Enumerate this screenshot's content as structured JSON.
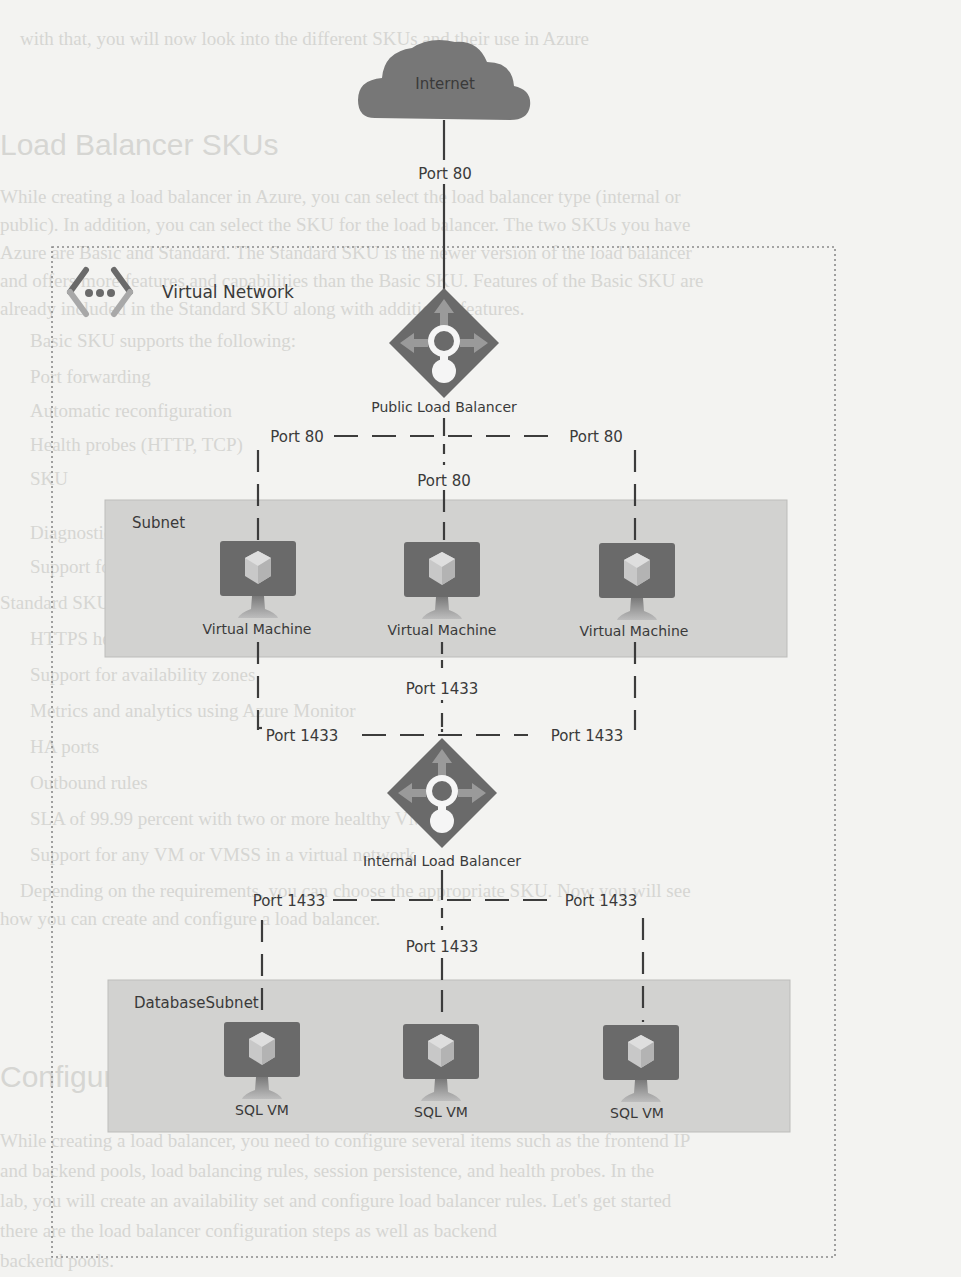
{
  "diagram": {
    "internet": {
      "label": "Internet"
    },
    "virtual_network": {
      "label": "Virtual Network"
    },
    "public_lb": {
      "label": "Public Load Balancer"
    },
    "internal_lb": {
      "label": "Internal Load Balancer"
    },
    "subnet": {
      "label": "Subnet",
      "vms": [
        {
          "label": "Virtual Machine"
        },
        {
          "label": "Virtual Machine"
        },
        {
          "label": "Virtual Machine"
        }
      ]
    },
    "database_subnet": {
      "label": "DatabaseSubnet",
      "vms": [
        {
          "label": "SQL VM"
        },
        {
          "label": "SQL VM"
        },
        {
          "label": "SQL VM"
        }
      ]
    },
    "ports": {
      "internet_to_public_lb": "Port 80",
      "public_lb_left": "Port 80",
      "public_lb_right": "Port 80",
      "public_lb_center": "Port 80",
      "vm_to_internal_lb_center": "Port 1433",
      "internal_lb_in_left": "Port 1433",
      "internal_lb_in_right": "Port 1433",
      "internal_lb_out_left": "Port 1433",
      "internal_lb_out_right": "Port 1433",
      "internal_lb_out_center": "Port 1433"
    },
    "colors": {
      "icon_dark": "#6e6e6e",
      "icon_light": "#a8a8a8",
      "cloud": "#777777",
      "subnet_fill": "#d2d2d0",
      "line": "#3c3c3c",
      "page_bg": "#f3f3f1"
    }
  },
  "background_page": {
    "heading_1": "Load Balancer SKUs",
    "heading_2": "Configure a Load Balancer",
    "lines": [
      "with that, you will now look into the different SKUs and their use in Azure",
      "While creating a load balancer in Azure, you can select the load balancer type (internal or",
      "public). In addition, you can select the SKU for the load balancer. The two SKUs you have",
      "Azure are Basic and Standard. The Standard SKU is the newer version of the load balancer",
      "and offers more features and capabilities than the Basic SKU. Features of the Basic SKU are",
      "already included in the Standard SKU along with additional features.",
      "Basic SKU supports the following:",
      "Port forwarding",
      "Automatic reconfiguration",
      "Health probes (HTTP, TCP)",
      "SKU",
      "Diagnostics using Azure Log Analytics",
      "Support for VMs in a single availability set or VMSS",
      "Standard SKU supports all features of the Basic SKU, along with the following features:",
      "HTTPS health probes",
      "Support for availability zones",
      "Metrics and analytics using Azure Monitor",
      "HA ports",
      "Outbound rules",
      "SLA of 99.99 percent with two or more healthy VMs",
      "Support for any VM or VMSS in a virtual network",
      "Depending on the requirements, you can choose the appropriate SKU. Now you will see",
      "how you can create and configure a load balancer.",
      "While creating a load balancer, you need to configure several items such as the frontend IP",
      "and backend pools, load balancing rules, session persistence, and health probes. In the",
      "lab, you will create an availability set and configure load balancer rules. Let's get started",
      "there are the load balancer configuration steps as well as backend",
      "backend pools."
    ]
  }
}
